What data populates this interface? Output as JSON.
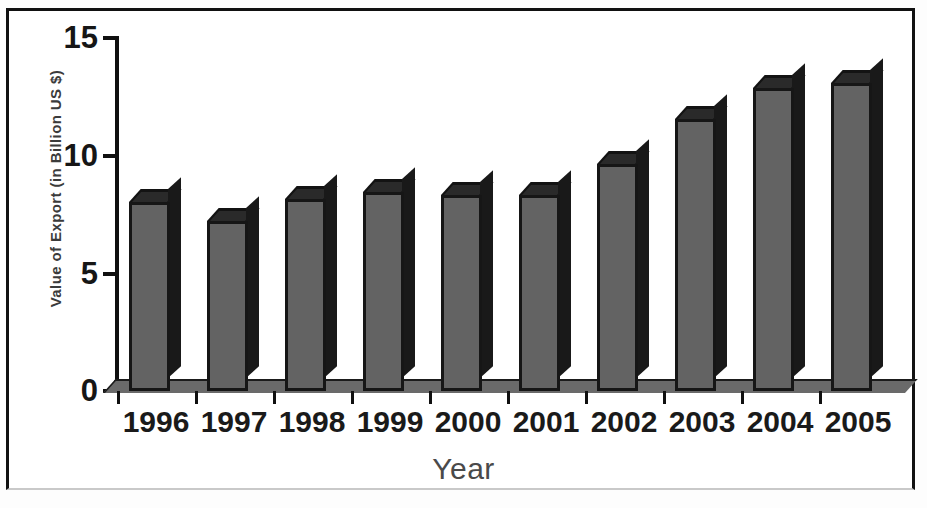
{
  "chart_data": {
    "type": "bar",
    "title": "",
    "xlabel": "Year",
    "ylabel": "Value of Export (in Billion US $)",
    "categories": [
      "1996",
      "1997",
      "1998",
      "1999",
      "2000",
      "2001",
      "2002",
      "2003",
      "2004",
      "2005"
    ],
    "values": [
      8.0,
      7.2,
      8.1,
      8.4,
      8.3,
      8.3,
      9.6,
      11.5,
      12.8,
      13.0
    ],
    "ylim": [
      0,
      15
    ],
    "y_ticks": [
      "0",
      "5",
      "10",
      "15"
    ],
    "y_tick_values": [
      0,
      5,
      10,
      15
    ],
    "grid": false,
    "legend": false,
    "legend_position": "none",
    "style": "3d-bar",
    "colors": {
      "bar_face": "#636363",
      "bar_edge": "#161616",
      "bar_side": "#191919",
      "axis": "#101010",
      "text": "#1a1a1a",
      "background": "#ffffff",
      "frame": "#111111"
    }
  }
}
